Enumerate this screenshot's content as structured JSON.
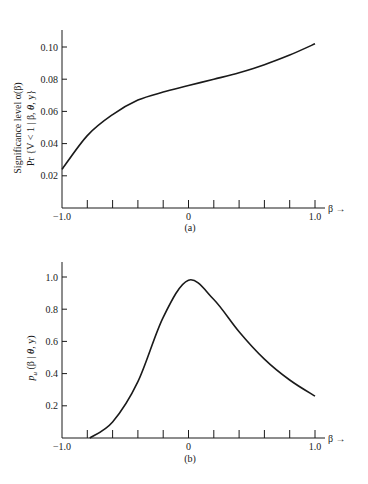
{
  "chart_data": [
    {
      "type": "line",
      "panel": "(a)",
      "title": "",
      "xlabel": "β →",
      "ylabel_line1": "Significance level α(β)",
      "ylabel_line2": "Pr {V < 1 | β, θ, y}",
      "xlim": [
        -1.0,
        1.0
      ],
      "ylim": [
        0.0,
        0.11
      ],
      "x_tick_labels": [
        "-1.0",
        "0",
        "1.0"
      ],
      "x_minor_ticks": [
        -0.8,
        -0.6,
        -0.4,
        -0.2,
        0,
        0.2,
        0.4,
        0.6,
        0.8,
        1.0
      ],
      "y_ticks": [
        0.02,
        0.04,
        0.06,
        0.08,
        0.1
      ],
      "y_tick_labels": [
        "0.02",
        "0.04",
        "0.06",
        "0.08",
        "0.10"
      ],
      "grid": false,
      "x": [
        -1.0,
        -0.8,
        -0.6,
        -0.4,
        -0.2,
        0.0,
        0.2,
        0.4,
        0.6,
        0.8,
        1.0
      ],
      "values": [
        0.024,
        0.045,
        0.058,
        0.067,
        0.072,
        0.076,
        0.08,
        0.084,
        0.089,
        0.095,
        0.102
      ]
    },
    {
      "type": "line",
      "panel": "(b)",
      "title": "",
      "xlabel": "β →",
      "ylabel": "p_u(β | θ, y)",
      "xlim": [
        -1.0,
        1.0
      ],
      "ylim": [
        0.0,
        1.1
      ],
      "x_tick_labels": [
        "-1.0",
        "0",
        "1.0"
      ],
      "x_minor_ticks": [
        -0.8,
        -0.6,
        -0.4,
        -0.2,
        0,
        0.2,
        0.4,
        0.6,
        0.8,
        1.0
      ],
      "y_ticks": [
        0.2,
        0.4,
        0.6,
        0.8,
        1.0
      ],
      "y_tick_labels": [
        "0.2",
        "0.4",
        "0.6",
        "0.8",
        "1.0"
      ],
      "grid": false,
      "x": [
        -0.78,
        -0.6,
        -0.4,
        -0.2,
        0.0,
        0.2,
        0.4,
        0.6,
        0.8,
        1.0
      ],
      "values": [
        0.0,
        0.1,
        0.35,
        0.75,
        0.98,
        0.86,
        0.66,
        0.49,
        0.36,
        0.26
      ]
    }
  ],
  "captions": {
    "a": "(a)",
    "b": "(b)"
  },
  "labels": {
    "a_ylabel_1": "Significance level α(β)",
    "a_ylabel_2_pre": "Pr {V < 1 | β, ",
    "a_ylabel_2_theta": "θ",
    "a_ylabel_2_post": ", y}",
    "b_ylabel_p": "p",
    "b_ylabel_sub": "u",
    "b_ylabel_pre": " (β | ",
    "b_ylabel_theta": "θ",
    "b_ylabel_post": ", y)",
    "xlabel": "β →"
  }
}
